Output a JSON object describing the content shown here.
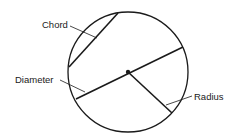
{
  "diagram": {
    "labels": {
      "chord": "Chord",
      "diameter": "Diameter",
      "radius": "Radius"
    },
    "colors": {
      "stroke": "#1a1a1a",
      "background": "#ffffff"
    }
  }
}
